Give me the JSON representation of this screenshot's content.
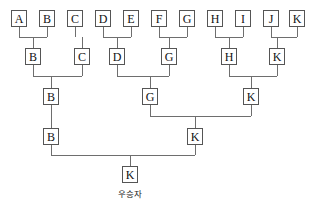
{
  "diagram": {
    "caption": "우승자",
    "box_width": 16,
    "box_height": 17,
    "line_color": "#6e6e6e",
    "box_border_color": "#555555",
    "background_color": "#ffffff",
    "text_color": "#111111"
  },
  "rounds": [
    {
      "name": "round-1",
      "y": 10,
      "nodes": [
        {
          "label": "A",
          "x": 11
        },
        {
          "label": "B",
          "x": 39
        },
        {
          "label": "C",
          "x": 67
        },
        {
          "label": "D",
          "x": 95
        },
        {
          "label": "E",
          "x": 123
        },
        {
          "label": "F",
          "x": 151
        },
        {
          "label": "G",
          "x": 179
        },
        {
          "label": "H",
          "x": 207
        },
        {
          "label": "I",
          "x": 235
        },
        {
          "label": "J",
          "x": 263
        },
        {
          "label": "K",
          "x": 289
        }
      ]
    },
    {
      "name": "round-2",
      "y": 48,
      "nodes": [
        {
          "label": "B",
          "x": 25
        },
        {
          "label": "C",
          "x": 74
        },
        {
          "label": "D",
          "x": 109
        },
        {
          "label": "G",
          "x": 161
        },
        {
          "label": "H",
          "x": 221
        },
        {
          "label": "K",
          "x": 269
        }
      ]
    },
    {
      "name": "round-3",
      "y": 88,
      "nodes": [
        {
          "label": "B",
          "x": 43
        },
        {
          "label": "G",
          "x": 142
        },
        {
          "label": "K",
          "x": 243
        }
      ]
    },
    {
      "name": "round-4",
      "y": 128,
      "nodes": [
        {
          "label": "B",
          "x": 43
        },
        {
          "label": "K",
          "x": 187
        }
      ]
    },
    {
      "name": "final",
      "y": 166,
      "nodes": [
        {
          "label": "K",
          "x": 122
        }
      ]
    }
  ],
  "connectors": {
    "round1_to_round2": [
      {
        "left_x": 19,
        "right_x": 47,
        "bar_y": 37,
        "drop_x": 33,
        "bar_from": 27,
        "bar_to": 48
      },
      {
        "left_x": 75,
        "right_x": 75,
        "bar_y": 37,
        "drop_x": 82,
        "bar_from": 27,
        "bar_to": 48
      },
      {
        "left_x": 103,
        "right_x": 131,
        "bar_y": 37,
        "drop_x": 117,
        "bar_from": 27,
        "bar_to": 48
      },
      {
        "left_x": 159,
        "right_x": 187,
        "bar_y": 37,
        "drop_x": 169,
        "bar_from": 27,
        "bar_to": 48
      },
      {
        "left_x": 215,
        "right_x": 243,
        "bar_y": 37,
        "drop_x": 229,
        "bar_from": 27,
        "bar_to": 48
      },
      {
        "left_x": 271,
        "right_x": 297,
        "bar_y": 37,
        "drop_x": 277,
        "bar_from": 27,
        "bar_to": 48
      }
    ],
    "round2_to_round3": [
      {
        "left_x": 33,
        "right_x": 82,
        "bar_y": 76,
        "drop_x": 51
      },
      {
        "left_x": 117,
        "right_x": 169,
        "bar_y": 76,
        "drop_x": 150
      },
      {
        "left_x": 229,
        "right_x": 277,
        "bar_y": 76,
        "drop_x": 251
      }
    ],
    "round3_to_round4": [
      {
        "left_x": 150,
        "right_x": 251,
        "bar_y": 116,
        "drop_x": 195
      }
    ],
    "round4_to_final": [
      {
        "left_x": 51,
        "right_x": 195,
        "bar_y": 155,
        "drop_x": 130
      }
    ],
    "straight_drops": [
      {
        "x": 51,
        "from": 105,
        "to": 128
      }
    ]
  }
}
